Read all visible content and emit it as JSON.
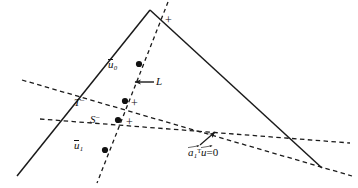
{
  "figure": {
    "type": "geometric-diagram",
    "background_color": "#ffffff",
    "line_color": "#1a1a1a",
    "width": 358,
    "height": 188
  },
  "labels": {
    "u0": {
      "base": "u",
      "subscript": "0",
      "overline": true,
      "text": "u̅0"
    },
    "u1": {
      "base": "u",
      "subscript": "1",
      "overline": true,
      "text": "u̅1"
    },
    "T_minus": {
      "base": "T",
      "superscript": "−",
      "text": "T⁻"
    },
    "S_minus": {
      "base": "S",
      "superscript": "−",
      "text": "S⁻"
    },
    "L": {
      "text": "L"
    },
    "equation": {
      "vector_a": "a",
      "a_subscript": "1",
      "transpose": "T",
      "vector_u": "u",
      "relation": "=0",
      "text": "a⃗1ᵀu⃗=0"
    }
  },
  "markers": {
    "plus_top": "+",
    "plus_mid": "+",
    "plus_low": "+"
  },
  "geometry": {
    "cone_apex": [
      150,
      10
    ],
    "cone_left_end": [
      17,
      176
    ],
    "cone_right_end": [
      322,
      168
    ],
    "steep_dashed_line": {
      "from": [
        168,
        2
      ],
      "to": [
        97,
        183
      ]
    },
    "upper_dashed_line": {
      "from": [
        22,
        80
      ],
      "to": [
        352,
        176
      ]
    },
    "lower_dashed_line": {
      "from": [
        40,
        119
      ],
      "to": [
        350,
        143
      ]
    },
    "points": [
      {
        "name": "u0-point",
        "at": [
          139,
          64
        ]
      },
      {
        "name": "T-point",
        "at": [
          125,
          101
        ]
      },
      {
        "name": "S-point",
        "at": [
          118,
          120
        ]
      },
      {
        "name": "u1-point",
        "at": [
          105,
          150
        ]
      }
    ],
    "arrow_L": {
      "from": [
        155,
        82
      ],
      "to": [
        133,
        82
      ]
    },
    "arrow_equation": {
      "from": [
        200,
        146
      ],
      "to": [
        216,
        131
      ]
    }
  }
}
